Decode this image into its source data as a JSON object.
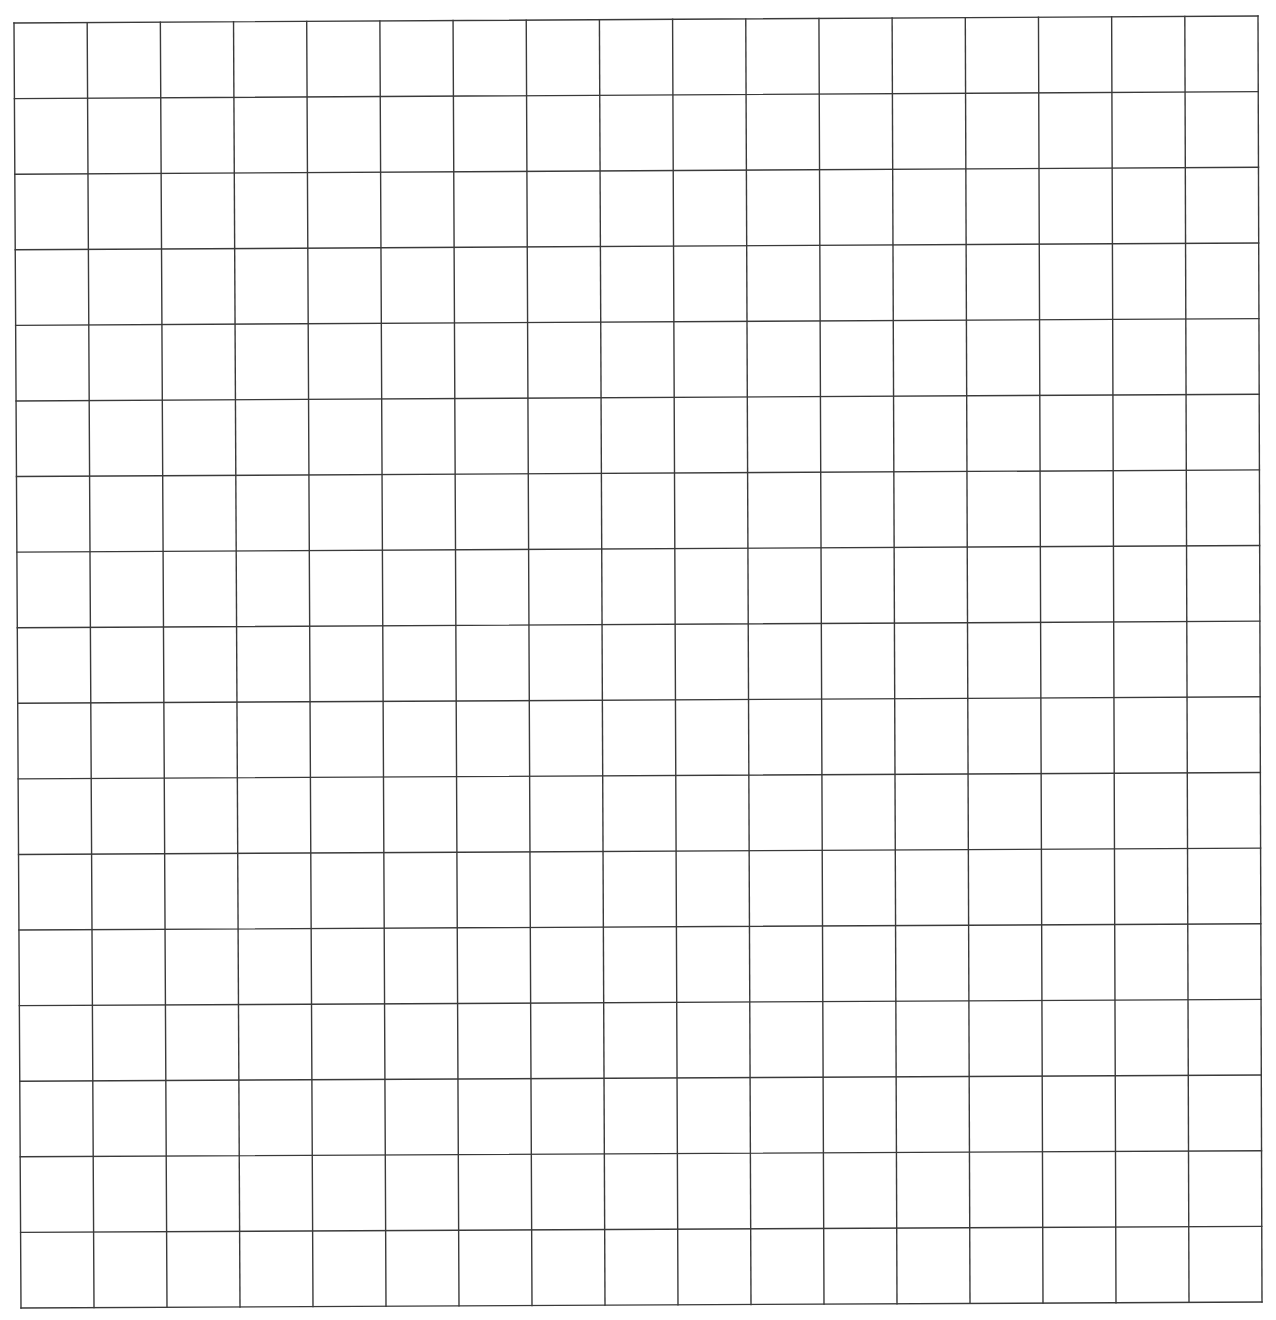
{
  "grid": {
    "columns": 17,
    "rows": 17,
    "corners": {
      "top_left": [
        14,
        23
      ],
      "top_right": [
        1258,
        16
      ],
      "bottom_right": [
        1262,
        1302
      ],
      "bottom_left": [
        21,
        1308
      ]
    },
    "line_color": "#3a3a3a",
    "background": "#ffffff",
    "line_width": 1.4
  }
}
